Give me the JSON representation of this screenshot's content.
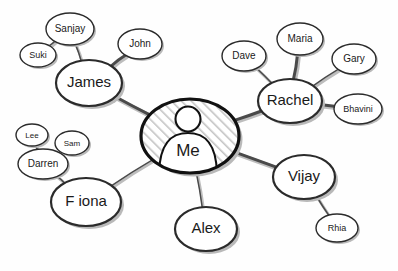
{
  "diagram": {
    "style": "hand-drawn sketch",
    "background_color": "#fefefe",
    "ink_color": "#2b2b2b",
    "shadow_color": "#b9b9b9",
    "hatch_color": "#c9c9c9"
  },
  "center": {
    "id": "me",
    "label": "Me",
    "avatar_icon": "person-silhouette-icon",
    "cx": 190,
    "cy": 136,
    "rx": 49,
    "ry": 37,
    "fill": "hatched"
  },
  "nodes": [
    {
      "id": "james",
      "label": "James",
      "cx": 89,
      "cy": 83,
      "rx": 33,
      "ry": 23,
      "font_size": 15,
      "tier": 1
    },
    {
      "id": "rachel",
      "label": "Rachel",
      "cx": 290,
      "cy": 101,
      "rx": 32,
      "ry": 22,
      "font_size": 15,
      "tier": 1
    },
    {
      "id": "fiona",
      "label": "F iona",
      "cx": 86,
      "cy": 202,
      "rx": 35,
      "ry": 24,
      "font_size": 15,
      "tier": 1
    },
    {
      "id": "alex",
      "label": "Alex",
      "cx": 206,
      "cy": 229,
      "rx": 31,
      "ry": 22,
      "font_size": 15,
      "tier": 1
    },
    {
      "id": "vijay",
      "label": "Vijay",
      "cx": 304,
      "cy": 177,
      "rx": 31,
      "ry": 22,
      "font_size": 15,
      "tier": 1
    },
    {
      "id": "sanjay",
      "label": "Sanjay",
      "cx": 70,
      "cy": 29,
      "rx": 24,
      "ry": 16,
      "font_size": 10,
      "tier": 2
    },
    {
      "id": "suki",
      "label": "Suki",
      "cx": 38,
      "cy": 55,
      "rx": 18,
      "ry": 12,
      "font_size": 9,
      "tier": 2
    },
    {
      "id": "john",
      "label": "John",
      "cx": 140,
      "cy": 44,
      "rx": 22,
      "ry": 15,
      "font_size": 10,
      "tier": 2
    },
    {
      "id": "dave",
      "label": "Dave",
      "cx": 244,
      "cy": 56,
      "rx": 22,
      "ry": 15,
      "font_size": 10,
      "tier": 2
    },
    {
      "id": "maria",
      "label": "Maria",
      "cx": 300,
      "cy": 39,
      "rx": 23,
      "ry": 16,
      "font_size": 10,
      "tier": 2
    },
    {
      "id": "gary",
      "label": "Gary",
      "cx": 354,
      "cy": 59,
      "rx": 22,
      "ry": 15,
      "font_size": 10,
      "tier": 2
    },
    {
      "id": "bhavini",
      "label": "Bhavini",
      "cx": 358,
      "cy": 109,
      "rx": 24,
      "ry": 15,
      "font_size": 9,
      "tier": 2
    },
    {
      "id": "lee",
      "label": "Lee",
      "cx": 32,
      "cy": 135,
      "rx": 16,
      "ry": 11,
      "font_size": 8,
      "tier": 2
    },
    {
      "id": "sam",
      "label": "Sam",
      "cx": 72,
      "cy": 143,
      "rx": 17,
      "ry": 12,
      "font_size": 8,
      "tier": 2
    },
    {
      "id": "darren",
      "label": "Darren",
      "cx": 43,
      "cy": 164,
      "rx": 25,
      "ry": 15,
      "font_size": 10,
      "tier": 2
    },
    {
      "id": "rhia",
      "label": "Rhia",
      "cx": 337,
      "cy": 228,
      "rx": 21,
      "ry": 14,
      "font_size": 9,
      "tier": 2
    }
  ],
  "edges": [
    {
      "from": "me",
      "to": "james",
      "weight": "thick"
    },
    {
      "from": "me",
      "to": "rachel",
      "weight": "thick"
    },
    {
      "from": "me",
      "to": "fiona",
      "weight": "thin"
    },
    {
      "from": "me",
      "to": "alex",
      "weight": "thin"
    },
    {
      "from": "me",
      "to": "vijay",
      "weight": "thick"
    },
    {
      "from": "james",
      "to": "sanjay",
      "weight": "thin"
    },
    {
      "from": "james",
      "to": "john",
      "weight": "thick"
    },
    {
      "from": "sanjay",
      "to": "suki",
      "weight": "thin"
    },
    {
      "from": "rachel",
      "to": "dave",
      "weight": "thin"
    },
    {
      "from": "rachel",
      "to": "maria",
      "weight": "thick"
    },
    {
      "from": "rachel",
      "to": "gary",
      "weight": "thin"
    },
    {
      "from": "rachel",
      "to": "bhavini",
      "weight": "thick"
    },
    {
      "from": "fiona",
      "to": "darren",
      "weight": "thin"
    },
    {
      "from": "darren",
      "to": "lee",
      "weight": "thin"
    },
    {
      "from": "darren",
      "to": "sam",
      "weight": "thin"
    },
    {
      "from": "vijay",
      "to": "rhia",
      "weight": "thin"
    }
  ]
}
